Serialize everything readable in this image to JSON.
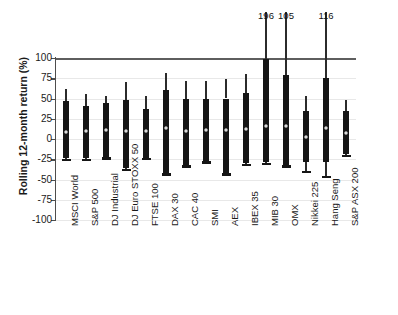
{
  "chart_data": {
    "type": "bar",
    "subtype": "box-whisker-range",
    "title": "",
    "xlabel": "",
    "ylabel": "Rolling 12-month return (%)",
    "ylim": [
      -100,
      100
    ],
    "ytick_labels": [
      "100",
      "75",
      "50",
      "25",
      "0",
      "-25",
      "-50",
      "-75",
      "-100"
    ],
    "yticks": [
      100,
      75,
      50,
      25,
      0,
      -25,
      -50,
      -75,
      -100
    ],
    "grid": true,
    "legend": "none",
    "categories": [
      "MSCI World",
      "S&P 500",
      "DJ Industrial",
      "DJ Euro STOXX 50",
      "FTSE 100",
      "DAX 30",
      "CAC 40",
      "SMI",
      "AEX",
      "IBEX 35",
      "MIB 30",
      "OMX",
      "Nikkei 225",
      "Hang Seng",
      "S&P ASX 200"
    ],
    "series": [
      {
        "name": "Rolling 12-month return range",
        "points": [
          {
            "category": "MSCI World",
            "max": 62,
            "box_top": 47,
            "mean": 9,
            "box_bottom": -24,
            "min": -26,
            "overflow_label": ""
          },
          {
            "category": "S&P 500",
            "max": 56,
            "box_top": 41,
            "mean": 10,
            "box_bottom": -24,
            "min": -26,
            "overflow_label": ""
          },
          {
            "category": "DJ Industrial",
            "max": 53,
            "box_top": 45,
            "mean": 11,
            "box_bottom": -22,
            "min": -24,
            "overflow_label": ""
          },
          {
            "category": "DJ Euro STOXX 50",
            "max": 70,
            "box_top": 48,
            "mean": 10,
            "box_bottom": -36,
            "min": -38,
            "overflow_label": ""
          },
          {
            "category": "FTSE 100",
            "max": 53,
            "box_top": 37,
            "mean": 10,
            "box_bottom": -23,
            "min": -25,
            "overflow_label": ""
          },
          {
            "category": "DAX 30",
            "max": 81,
            "box_top": 60,
            "mean": 13,
            "box_bottom": -42,
            "min": -44,
            "overflow_label": ""
          },
          {
            "category": "CAC 40",
            "max": 72,
            "box_top": 49,
            "mean": 10,
            "box_bottom": -32,
            "min": -34,
            "overflow_label": ""
          },
          {
            "category": "SMI",
            "max": 72,
            "box_top": 49,
            "mean": 11,
            "box_bottom": -27,
            "min": -29,
            "overflow_label": ""
          },
          {
            "category": "AEX",
            "max": 74,
            "box_top": 50,
            "mean": 11,
            "box_bottom": -42,
            "min": -44,
            "overflow_label": ""
          },
          {
            "category": "IBEX 35",
            "max": 80,
            "box_top": 57,
            "mean": 12,
            "box_bottom": -30,
            "min": -32,
            "overflow_label": ""
          },
          {
            "category": "MIB 30",
            "max": 196,
            "box_top": 99,
            "mean": 16,
            "box_bottom": -29,
            "min": -31,
            "overflow_label": "196"
          },
          {
            "category": "OMX",
            "max": 105,
            "box_top": 79,
            "mean": 16,
            "box_bottom": -32,
            "min": -34,
            "overflow_label": "105"
          },
          {
            "category": "Nikkei 225",
            "max": 53,
            "box_top": 34,
            "mean": 3,
            "box_bottom": -28,
            "min": -41,
            "overflow_label": ""
          },
          {
            "category": "Hang Seng",
            "max": 116,
            "box_top": 75,
            "mean": 13,
            "box_bottom": -28,
            "min": -47,
            "overflow_label": "116"
          },
          {
            "category": "S&P ASX 200",
            "max": 48,
            "box_top": 35,
            "mean": 8,
            "box_bottom": -19,
            "min": -21,
            "overflow_label": ""
          }
        ]
      }
    ],
    "colors": {
      "box": "#151515",
      "whisker": "#2b2b2b",
      "gridline": "#e8e8e8",
      "zero_line": "#5e5e5e",
      "axis": "#4d4d4d",
      "mean_marker_edge": "#8a8a8a",
      "background": "#ffffff"
    }
  }
}
